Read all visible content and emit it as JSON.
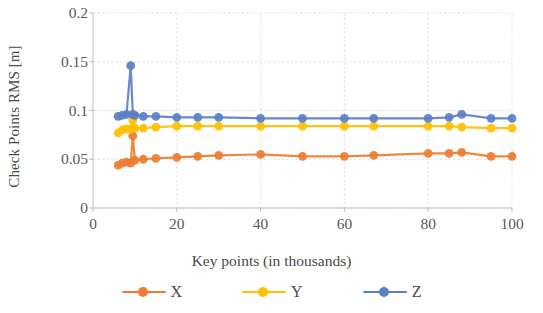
{
  "chart_data": {
    "type": "line",
    "title": "",
    "xlabel": "Key points (in thousands)",
    "ylabel": "Check Points RMS [m]",
    "xlim": [
      0,
      100
    ],
    "ylim": [
      0,
      0.2
    ],
    "xticks": [
      "0",
      "20",
      "40",
      "60",
      "80",
      "100"
    ],
    "xtick_values": [
      0,
      20,
      40,
      60,
      80,
      100
    ],
    "yticks": [
      "0",
      "0.05",
      "0.1",
      "0.15",
      "0.2"
    ],
    "ytick_values": [
      0,
      0.05,
      0.1,
      0.15,
      0.2
    ],
    "grid": true,
    "grid_axis": "both",
    "legend_position": "bottom",
    "x": [
      6,
      7,
      8,
      9,
      9.5,
      10,
      12,
      15,
      20,
      25,
      30,
      40,
      50,
      60,
      67,
      80,
      85,
      88,
      95,
      100
    ],
    "series": [
      {
        "name": "X",
        "color": "#ED7D31",
        "values": [
          0.044,
          0.046,
          0.047,
          0.046,
          0.074,
          0.049,
          0.05,
          0.051,
          0.052,
          0.053,
          0.054,
          0.055,
          0.053,
          0.053,
          0.054,
          0.056,
          0.056,
          0.057,
          0.053,
          0.053
        ]
      },
      {
        "name": "Y",
        "color": "#FFC000",
        "values": [
          0.077,
          0.08,
          0.081,
          0.081,
          0.09,
          0.082,
          0.082,
          0.083,
          0.084,
          0.084,
          0.084,
          0.084,
          0.084,
          0.084,
          0.084,
          0.084,
          0.084,
          0.083,
          0.082,
          0.082
        ]
      },
      {
        "name": "Z",
        "color": "#5B7FC7",
        "values": [
          0.094,
          0.095,
          0.096,
          0.146,
          0.096,
          0.095,
          0.094,
          0.094,
          0.093,
          0.093,
          0.093,
          0.092,
          0.092,
          0.092,
          0.092,
          0.092,
          0.093,
          0.096,
          0.092,
          0.092
        ]
      }
    ]
  },
  "legend": {
    "items": [
      {
        "label": "X"
      },
      {
        "label": "Y"
      },
      {
        "label": "Z"
      }
    ]
  },
  "colors": {
    "series_x": "#ED7D31",
    "series_y": "#FFC000",
    "series_z": "#5B7FC7",
    "grid": "#D9D9D9",
    "axis": "#BFBFBF",
    "text": "#595959"
  }
}
